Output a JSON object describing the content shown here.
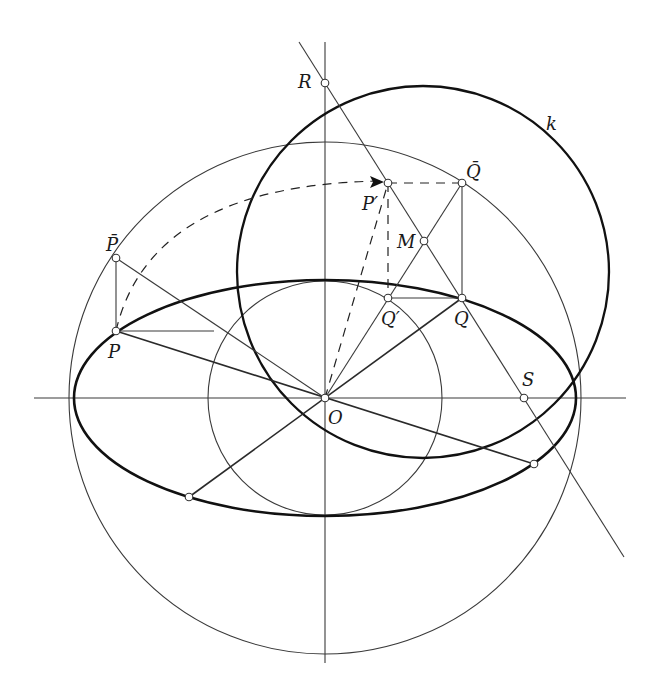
{
  "figure": {
    "labels": {
      "R": "R",
      "k": "k",
      "Qbar": "Q̄",
      "Pprime": "P′",
      "M": "M",
      "Pbar": "P̄",
      "P": "P",
      "Qprime": "Q′",
      "Q": "Q",
      "O": "O",
      "S": "S"
    },
    "colors": {
      "background": "#ffffff",
      "stroke": "#1a1a1a"
    }
  }
}
